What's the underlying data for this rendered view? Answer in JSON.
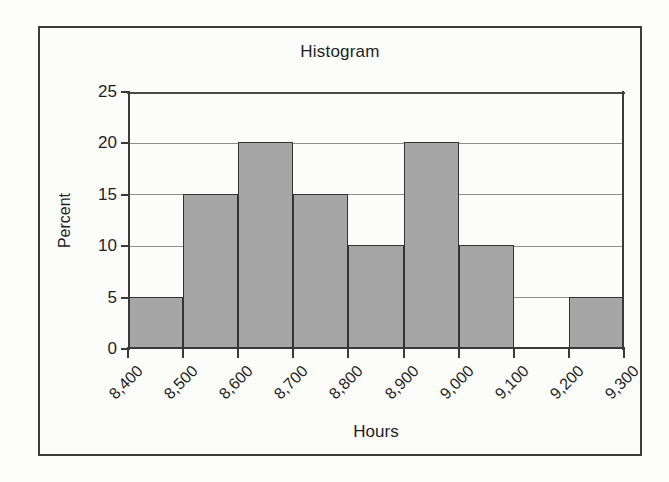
{
  "figure": {
    "title": "Histogram",
    "frame_color": "#3c3c3c",
    "background": "#fdfdfc"
  },
  "chart_data": {
    "type": "bar",
    "title": "Histogram",
    "subtitle": "",
    "xlabel": "Hours",
    "ylabel": "Percent",
    "bin_edges": [
      8400,
      8500,
      8600,
      8700,
      8800,
      8900,
      9000,
      9100,
      9200,
      9300
    ],
    "categories": [
      "8,400-8,500",
      "8,500-8,600",
      "8,600-8,700",
      "8,700-8,800",
      "8,800-8,900",
      "8,900-9,000",
      "9,000-9,100",
      "9,100-9,200",
      "9,200-9,300"
    ],
    "values": [
      5,
      15,
      20,
      15,
      10,
      20,
      10,
      0,
      5
    ],
    "xtick_labels": [
      "8,400",
      "8,500",
      "8,600",
      "8,700",
      "8,800",
      "8,900",
      "9,000",
      "9,100",
      "9,200",
      "9,300"
    ],
    "ytick_labels": [
      "0",
      "5",
      "10",
      "15",
      "20",
      "25"
    ],
    "ytick_values": [
      0,
      5,
      10,
      15,
      20,
      25
    ],
    "ylim": [
      0,
      25
    ],
    "xlim": [
      8400,
      9300
    ],
    "grid": true,
    "grid_axis": "y",
    "legend": null,
    "bar_fill_color": "#a6a6a6",
    "bar_edge_color": "#333333",
    "xtick_label_rotation": -45
  }
}
